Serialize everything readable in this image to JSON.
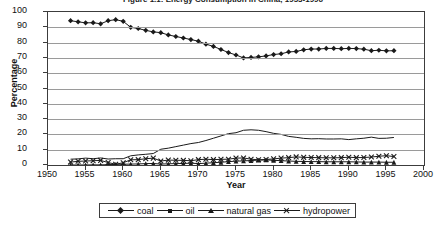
{
  "chart_data": {
    "type": "line",
    "title": "Figure 1.1: Energy Consumption in China, 1953-1996",
    "xlabel": "Year",
    "ylabel": "Percentage",
    "xlim": [
      1950,
      2000
    ],
    "ylim": [
      0,
      100
    ],
    "xticks": [
      1950,
      1955,
      1960,
      1965,
      1970,
      1975,
      1980,
      1985,
      1990,
      1995,
      2000
    ],
    "yticks": [
      0,
      10,
      20,
      30,
      40,
      50,
      60,
      70,
      80,
      90,
      100
    ],
    "grid": "horizontal",
    "legend_position": "bottom",
    "x": [
      1953,
      1954,
      1955,
      1956,
      1957,
      1958,
      1959,
      1960,
      1961,
      1962,
      1963,
      1964,
      1965,
      1966,
      1967,
      1968,
      1969,
      1970,
      1971,
      1972,
      1973,
      1974,
      1975,
      1976,
      1977,
      1978,
      1979,
      1980,
      1981,
      1982,
      1983,
      1984,
      1985,
      1986,
      1987,
      1988,
      1989,
      1990,
      1991,
      1992,
      1993,
      1994,
      1995,
      1996
    ],
    "series": [
      {
        "name": "coal",
        "marker": "diamond",
        "values": [
          94.3,
          93.6,
          92.9,
          93.0,
          92.3,
          94.3,
          95.0,
          93.9,
          90.0,
          89.2,
          88.0,
          87.0,
          86.5,
          85.0,
          84.0,
          83.0,
          82.0,
          80.9,
          79.0,
          77.5,
          75.5,
          73.5,
          71.9,
          70.0,
          70.3,
          70.7,
          71.3,
          72.2,
          72.7,
          73.9,
          74.2,
          75.3,
          75.8,
          75.8,
          76.2,
          76.2,
          76.0,
          76.2,
          76.1,
          75.7,
          74.7,
          75.0,
          74.6,
          74.7
        ]
      },
      {
        "name": "oil",
        "marker": "none",
        "values": [
          3.8,
          4.0,
          4.5,
          4.1,
          4.6,
          3.9,
          4.1,
          4.1,
          6.0,
          6.6,
          7.0,
          7.5,
          10.3,
          11.0,
          12.0,
          13.0,
          14.0,
          14.7,
          16.0,
          17.5,
          19.0,
          20.5,
          21.1,
          22.7,
          23.0,
          22.7,
          21.8,
          20.7,
          20.0,
          18.7,
          18.1,
          17.4,
          17.1,
          17.2,
          17.0,
          17.0,
          17.1,
          16.6,
          17.1,
          17.5,
          18.2,
          17.4,
          17.5,
          18.0
        ]
      },
      {
        "name": "natural gas",
        "marker": "triangle",
        "values": [
          0.02,
          0.02,
          0.03,
          0.1,
          0.1,
          0.2,
          0.4,
          0.5,
          0.6,
          0.7,
          0.9,
          1.0,
          0.6,
          0.8,
          0.9,
          1.0,
          1.2,
          0.9,
          1.2,
          1.5,
          1.8,
          2.2,
          2.5,
          2.7,
          2.9,
          3.2,
          3.3,
          3.1,
          2.8,
          2.6,
          2.4,
          2.3,
          2.2,
          2.2,
          2.1,
          2.1,
          2.1,
          2.1,
          2.0,
          1.9,
          1.9,
          1.9,
          1.8,
          1.8
        ]
      },
      {
        "name": "hydropower",
        "marker": "cross",
        "values": [
          1.9,
          2.4,
          2.6,
          2.8,
          3.0,
          1.6,
          0.5,
          1.5,
          3.4,
          3.5,
          4.1,
          4.5,
          2.6,
          3.2,
          3.1,
          3.0,
          2.8,
          3.5,
          3.8,
          3.5,
          3.7,
          3.8,
          4.5,
          4.6,
          3.8,
          3.4,
          3.6,
          4.0,
          4.5,
          4.8,
          5.3,
          5.0,
          4.9,
          4.8,
          4.7,
          4.7,
          4.8,
          5.1,
          4.8,
          4.9,
          5.2,
          5.7,
          6.1,
          5.5
        ]
      }
    ]
  },
  "axis": {
    "yticks": [
      "100",
      "90",
      "80",
      "70",
      "60",
      "50",
      "40",
      "30",
      "20",
      "10",
      "0"
    ],
    "xticks": [
      "1950",
      "1955",
      "1960",
      "1965",
      "1970",
      "1975",
      "1980",
      "1985",
      "1990",
      "1995",
      "2000"
    ],
    "ylabel": "Percentage",
    "xlabel": "Year"
  },
  "legend": {
    "items": [
      {
        "label": "coal",
        "marker": "diamond-marker"
      },
      {
        "label": "oil",
        "marker": "square-marker"
      },
      {
        "label": "natural gas",
        "marker": "triangle-marker"
      },
      {
        "label": "hydropower",
        "marker": "cross-marker"
      }
    ]
  },
  "colors": {
    "line": "#1a1a1a",
    "grid": "#9a9a9a",
    "frame": "#3c3c3c",
    "background": "#ffffff"
  }
}
